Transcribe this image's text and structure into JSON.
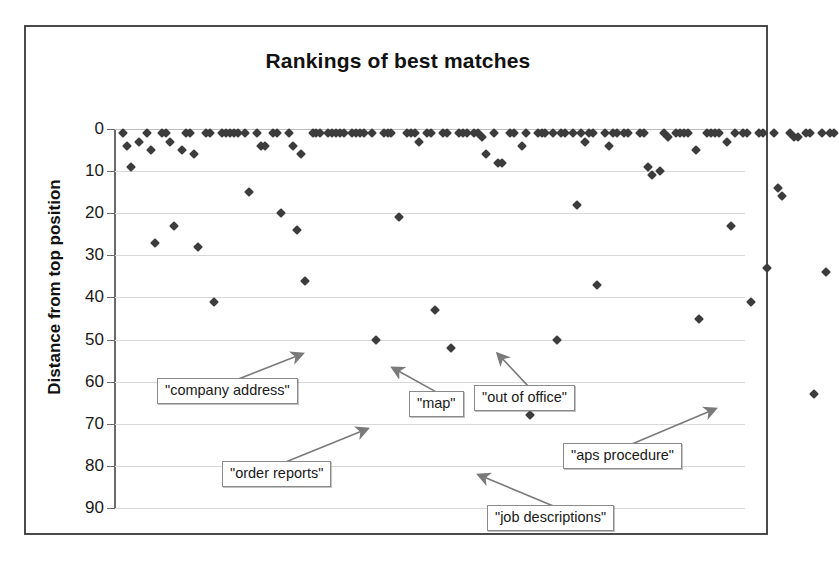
{
  "figure": {
    "title": "Rankings of best matches",
    "y_axis_title": "Distance from top position",
    "frame_color": "#4a4a4a",
    "marker_color": "#3c3c3c",
    "gridline_color": "#d8d8d8"
  },
  "axis": {
    "y_ticks": [
      "0",
      "10",
      "20",
      "30",
      "40",
      "50",
      "60",
      "70",
      "80",
      "90"
    ]
  },
  "annotations": [
    {
      "label": "\"company address\"",
      "value": 50
    },
    {
      "label": "\"map\"",
      "value": 52
    },
    {
      "label": "\"out of office\"",
      "value": 50
    },
    {
      "label": "\"order reports\"",
      "value": 68
    },
    {
      "label": "\"aps procedure\"",
      "value": 63
    },
    {
      "label": "\"job descriptions\"",
      "value": 78
    }
  ],
  "chart_data": {
    "type": "scatter",
    "title": "Rankings of best matches",
    "xlabel": "",
    "ylabel": "Distance from top position",
    "ylim": [
      0,
      90
    ],
    "y_inverted": true,
    "grid": true,
    "legend": "none",
    "x_axis_visible": false,
    "point_count": 156,
    "series": [
      {
        "name": "best match rank",
        "points": [
          [
            1,
            1
          ],
          [
            2,
            4
          ],
          [
            3,
            9
          ],
          [
            5,
            3
          ],
          [
            7,
            1
          ],
          [
            8,
            5
          ],
          [
            9,
            27
          ],
          [
            11,
            1
          ],
          [
            12,
            1
          ],
          [
            13,
            3
          ],
          [
            14,
            23
          ],
          [
            16,
            5
          ],
          [
            17,
            1
          ],
          [
            18,
            1
          ],
          [
            19,
            6
          ],
          [
            20,
            28
          ],
          [
            22,
            1
          ],
          [
            23,
            1
          ],
          [
            24,
            41
          ],
          [
            26,
            1
          ],
          [
            27,
            1
          ],
          [
            28,
            1
          ],
          [
            29,
            1
          ],
          [
            30,
            1
          ],
          [
            32,
            1
          ],
          [
            33,
            15
          ],
          [
            35,
            1
          ],
          [
            36,
            4
          ],
          [
            37,
            4
          ],
          [
            39,
            1
          ],
          [
            40,
            1
          ],
          [
            41,
            20
          ],
          [
            43,
            1
          ],
          [
            44,
            4
          ],
          [
            45,
            24
          ],
          [
            46,
            6
          ],
          [
            47,
            36
          ],
          [
            49,
            1
          ],
          [
            50,
            1
          ],
          [
            51,
            1
          ],
          [
            53,
            1
          ],
          [
            54,
            1
          ],
          [
            55,
            1
          ],
          [
            56,
            1
          ],
          [
            57,
            1
          ],
          [
            59,
            1
          ],
          [
            60,
            1
          ],
          [
            61,
            1
          ],
          [
            62,
            1
          ],
          [
            64,
            1
          ],
          [
            65,
            50
          ],
          [
            67,
            1
          ],
          [
            68,
            1
          ],
          [
            69,
            1
          ],
          [
            71,
            21
          ],
          [
            73,
            1
          ],
          [
            74,
            1
          ],
          [
            75,
            1
          ],
          [
            76,
            3
          ],
          [
            78,
            1
          ],
          [
            79,
            1
          ],
          [
            80,
            43
          ],
          [
            82,
            1
          ],
          [
            83,
            1
          ],
          [
            84,
            52
          ],
          [
            86,
            1
          ],
          [
            87,
            1
          ],
          [
            88,
            1
          ],
          [
            90,
            1
          ],
          [
            91,
            1
          ],
          [
            92,
            2
          ],
          [
            93,
            6
          ],
          [
            95,
            1
          ],
          [
            96,
            8
          ],
          [
            97,
            8
          ],
          [
            99,
            1
          ],
          [
            100,
            1
          ],
          [
            102,
            4
          ],
          [
            103,
            1
          ],
          [
            104,
            68
          ],
          [
            106,
            1
          ],
          [
            107,
            1
          ],
          [
            108,
            1
          ],
          [
            110,
            1
          ],
          [
            111,
            50
          ],
          [
            112,
            1
          ],
          [
            113,
            1
          ],
          [
            115,
            1
          ],
          [
            116,
            18
          ],
          [
            117,
            1
          ],
          [
            118,
            3
          ],
          [
            119,
            1
          ],
          [
            120,
            1
          ],
          [
            121,
            37
          ],
          [
            123,
            1
          ],
          [
            124,
            4
          ],
          [
            125,
            1
          ],
          [
            126,
            1
          ],
          [
            128,
            1
          ],
          [
            129,
            1
          ],
          [
            130,
            78
          ],
          [
            132,
            1
          ],
          [
            133,
            1
          ],
          [
            134,
            9
          ],
          [
            135,
            11
          ],
          [
            137,
            10
          ],
          [
            138,
            1
          ],
          [
            139,
            2
          ],
          [
            141,
            1
          ],
          [
            142,
            1
          ],
          [
            143,
            1
          ],
          [
            144,
            1
          ],
          [
            146,
            5
          ],
          [
            147,
            45
          ],
          [
            149,
            1
          ],
          [
            150,
            1
          ],
          [
            151,
            1
          ],
          [
            152,
            1
          ],
          [
            154,
            3
          ],
          [
            155,
            23
          ],
          [
            156,
            1
          ],
          [
            158,
            1
          ],
          [
            159,
            1
          ],
          [
            160,
            41
          ],
          [
            162,
            1
          ],
          [
            163,
            1
          ],
          [
            164,
            33
          ],
          [
            166,
            1
          ],
          [
            167,
            14
          ],
          [
            168,
            16
          ],
          [
            170,
            1
          ],
          [
            171,
            2
          ],
          [
            172,
            2
          ],
          [
            174,
            1
          ],
          [
            175,
            1
          ],
          [
            176,
            63
          ],
          [
            178,
            1
          ],
          [
            179,
            34
          ],
          [
            180,
            1
          ],
          [
            181,
            1
          ]
        ]
      }
    ]
  }
}
